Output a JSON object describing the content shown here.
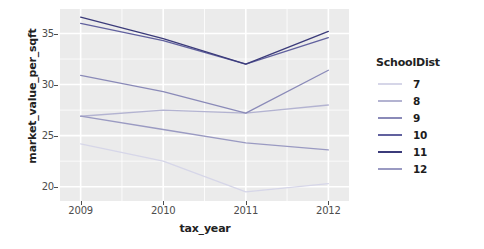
{
  "chart_data": {
    "type": "line",
    "title": "",
    "xlabel": "tax_year",
    "ylabel": "market_value_per_sqft",
    "x": [
      2009,
      2010,
      2011,
      2012
    ],
    "xticklabels": [
      "2009",
      "2010",
      "2011",
      "2012"
    ],
    "yticklabels": [
      "20",
      "25",
      "30",
      "35"
    ],
    "yticks": [
      20,
      25,
      30,
      35
    ],
    "xlim": [
      2008.75,
      2012.25
    ],
    "ylim": [
      18.6,
      37.4
    ],
    "grid": true,
    "legend_position": "right",
    "legend_title": "SchoolDist",
    "panel_background": "#ebebeb",
    "grid_color": "#ffffff",
    "series": [
      {
        "name": "7",
        "color": "#d6d6e8",
        "values": [
          24.2,
          22.5,
          19.5,
          20.3
        ]
      },
      {
        "name": "8",
        "color": "#b3b3d1",
        "values": [
          26.9,
          27.5,
          27.2,
          28.0
        ]
      },
      {
        "name": "9",
        "color": "#8a8ab8",
        "values": [
          30.9,
          29.3,
          27.2,
          31.4
        ]
      },
      {
        "name": "10",
        "color": "#61619e",
        "values": [
          36.0,
          34.3,
          32.0,
          34.6
        ]
      },
      {
        "name": "11",
        "color": "#3b3b7a",
        "values": [
          36.6,
          34.5,
          32.0,
          35.2
        ]
      },
      {
        "name": "12",
        "color": "#9a9ac2",
        "values": [
          26.9,
          25.6,
          24.3,
          23.6
        ]
      }
    ]
  },
  "axes": {
    "y_title": "market_value_per_sqft",
    "x_title": "tax_year",
    "y_tick_labels": [
      "35",
      "30",
      "25",
      "20"
    ],
    "x_tick_labels": [
      "2009",
      "2010",
      "2011",
      "2012"
    ]
  },
  "legend": {
    "title": "SchoolDist",
    "items": [
      {
        "label": "7",
        "color": "#d6d6e8"
      },
      {
        "label": "8",
        "color": "#b3b3d1"
      },
      {
        "label": "9",
        "color": "#8a8ab8"
      },
      {
        "label": "10",
        "color": "#61619e"
      },
      {
        "label": "11",
        "color": "#3b3b7a"
      },
      {
        "label": "12",
        "color": "#9a9ac2"
      }
    ]
  }
}
